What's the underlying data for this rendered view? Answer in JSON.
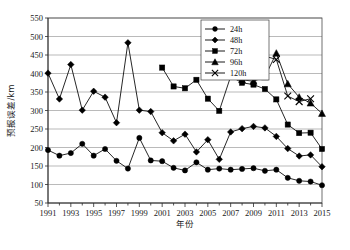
{
  "chart_data": {
    "type": "line",
    "title": "",
    "xlabel": "年份",
    "ylabel": "预报误差/km",
    "xlim": [
      1991,
      2015
    ],
    "ylim": [
      50,
      550
    ],
    "yticks": [
      50,
      100,
      150,
      200,
      250,
      300,
      350,
      400,
      450,
      500,
      550
    ],
    "xticks": [
      1991,
      1993,
      1995,
      1997,
      1999,
      2001,
      2003,
      2005,
      2007,
      2009,
      2011,
      2013,
      2015
    ],
    "xtick_labels": [
      "1991",
      "1993",
      "1995",
      "1997",
      "1999",
      "2001",
      "2003",
      "2005",
      "2007",
      "2009",
      "2011",
      "2013",
      "2015"
    ],
    "ytick_labels": [
      "50",
      "100",
      "150",
      "200",
      "250",
      "300",
      "350",
      "400",
      "450",
      "500",
      "550"
    ],
    "grid": "horizontal",
    "legend_position": "top-right",
    "x": [
      1991,
      1992,
      1993,
      1994,
      1995,
      1996,
      1997,
      1998,
      1999,
      2000,
      2001,
      2002,
      2003,
      2004,
      2005,
      2006,
      2007,
      2008,
      2009,
      2010,
      2011,
      2012,
      2013,
      2014,
      2015
    ],
    "series": [
      {
        "name": "24h",
        "marker": "circle",
        "x": [
          1991,
          1992,
          1993,
          1994,
          1995,
          1996,
          1997,
          1998,
          1999,
          2000,
          2001,
          2002,
          2003,
          2004,
          2005,
          2006,
          2007,
          2008,
          2009,
          2010,
          2011,
          2012,
          2013,
          2014,
          2015
        ],
        "values": [
          193,
          178,
          185,
          210,
          178,
          196,
          164,
          143,
          226,
          165,
          163,
          145,
          138,
          160,
          140,
          143,
          140,
          142,
          144,
          137,
          140,
          118,
          110,
          108,
          98
        ]
      },
      {
        "name": "48h",
        "marker": "diamond",
        "x": [
          1991,
          1992,
          1993,
          1994,
          1995,
          1996,
          1997,
          1998,
          1999,
          2000,
          2001,
          2002,
          2003,
          2004,
          2005,
          2006,
          2007,
          2008,
          2009,
          2010,
          2011,
          2012,
          2013,
          2014,
          2015
        ],
        "values": [
          401,
          331,
          424,
          301,
          352,
          336,
          267,
          483,
          301,
          297,
          240,
          218,
          236,
          188,
          221,
          168,
          242,
          251,
          257,
          253,
          230,
          197,
          177,
          180,
          148
        ]
      },
      {
        "name": "72h",
        "marker": "square",
        "x": [
          2001,
          2002,
          2003,
          2004,
          2005,
          2006,
          2007,
          2008,
          2009,
          2010,
          2011,
          2012,
          2013,
          2014,
          2015
        ],
        "values": [
          416,
          365,
          360,
          383,
          332,
          299,
          392,
          375,
          370,
          358,
          330,
          262,
          239,
          240,
          196
        ]
      },
      {
        "name": "96h",
        "marker": "triangle",
        "x": [
          2007,
          2008,
          2009,
          2010,
          2011,
          2012,
          2013,
          2014,
          2015
        ],
        "values": [
          462,
          383,
          379,
          391,
          455,
          372,
          336,
          320,
          292
        ]
      },
      {
        "name": "120h",
        "marker": "cross",
        "x": [
          2007,
          2008,
          2009,
          2010,
          2011,
          2012,
          2013,
          2014,
          2015
        ],
        "values": [
          503,
          490,
          504,
          447,
          438,
          339,
          324,
          332,
          null
        ]
      }
    ]
  },
  "legend": {
    "items": [
      {
        "label": "24h",
        "marker": "circle"
      },
      {
        "label": "48h",
        "marker": "diamond"
      },
      {
        "label": "72h",
        "marker": "square"
      },
      {
        "label": "96h",
        "marker": "triangle"
      },
      {
        "label": "120h",
        "marker": "cross"
      }
    ]
  },
  "axes": {
    "y_title": "预报误差/km",
    "x_title": "年份"
  },
  "colors": {
    "series": "#000000",
    "grid": "#8c8c8c",
    "frame": "#4d4d4d",
    "background": "#ffffff"
  }
}
